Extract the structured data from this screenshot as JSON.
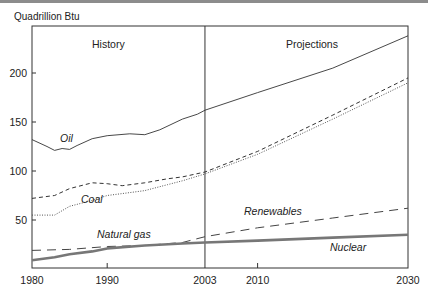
{
  "header": {
    "unit_label": "Quadrillion Btu"
  },
  "regions": {
    "history": "History",
    "projections": "Projections"
  },
  "chart_data": {
    "type": "line",
    "title": "",
    "xlabel": "",
    "ylabel": "Quadrillion Btu",
    "xlim": [
      1980,
      2030
    ],
    "ylim": [
      0,
      245
    ],
    "x_ticks": [
      1980,
      1990,
      2003,
      2010,
      2030
    ],
    "y_ticks": [
      50,
      100,
      150,
      200
    ],
    "grid": false,
    "legend_position": "inline labels",
    "annotations": [
      {
        "text": "History",
        "x": 1991
      },
      {
        "text": "Projections",
        "x": 2017
      },
      {
        "text": "divider at 2003",
        "x": 2003
      }
    ],
    "series": [
      {
        "name": "Oil",
        "style": "solid",
        "x": [
          1980,
          1982,
          1983,
          1984,
          1985,
          1986,
          1988,
          1990,
          1993,
          1995,
          1997,
          2000,
          2002,
          2003,
          2010,
          2020,
          2030
        ],
        "values": [
          132,
          125,
          121,
          123,
          122,
          126,
          133,
          136,
          138,
          137,
          142,
          153,
          158,
          162,
          180,
          205,
          238
        ]
      },
      {
        "name": "Coal",
        "style": "short-dash",
        "x": [
          1980,
          1983,
          1985,
          1988,
          1990,
          1992,
          1995,
          1998,
          2000,
          2003,
          2010,
          2020,
          2030
        ],
        "values": [
          72,
          75,
          82,
          88,
          87,
          85,
          88,
          92,
          94,
          99,
          120,
          157,
          195
        ]
      },
      {
        "name": "Natural gas",
        "style": "dotted",
        "x": [
          1980,
          1983,
          1985,
          1988,
          1990,
          1993,
          1995,
          1998,
          2000,
          2003,
          2010,
          2020,
          2030
        ],
        "values": [
          55,
          55,
          64,
          70,
          75,
          78,
          80,
          86,
          90,
          97,
          117,
          153,
          190
        ]
      },
      {
        "name": "Renewables",
        "style": "long-dash",
        "x": [
          1980,
          1985,
          1990,
          1995,
          2000,
          2003,
          2010,
          2020,
          2030
        ],
        "values": [
          19,
          20,
          23,
          24,
          27,
          33,
          42,
          52,
          62
        ]
      },
      {
        "name": "Nuclear",
        "style": "thick-solid-gray",
        "x": [
          1980,
          1983,
          1985,
          1988,
          1990,
          1995,
          2000,
          2003,
          2010,
          2020,
          2030
        ],
        "values": [
          9,
          12,
          15,
          18,
          21,
          24,
          26,
          27,
          29,
          32,
          35
        ]
      }
    ]
  }
}
